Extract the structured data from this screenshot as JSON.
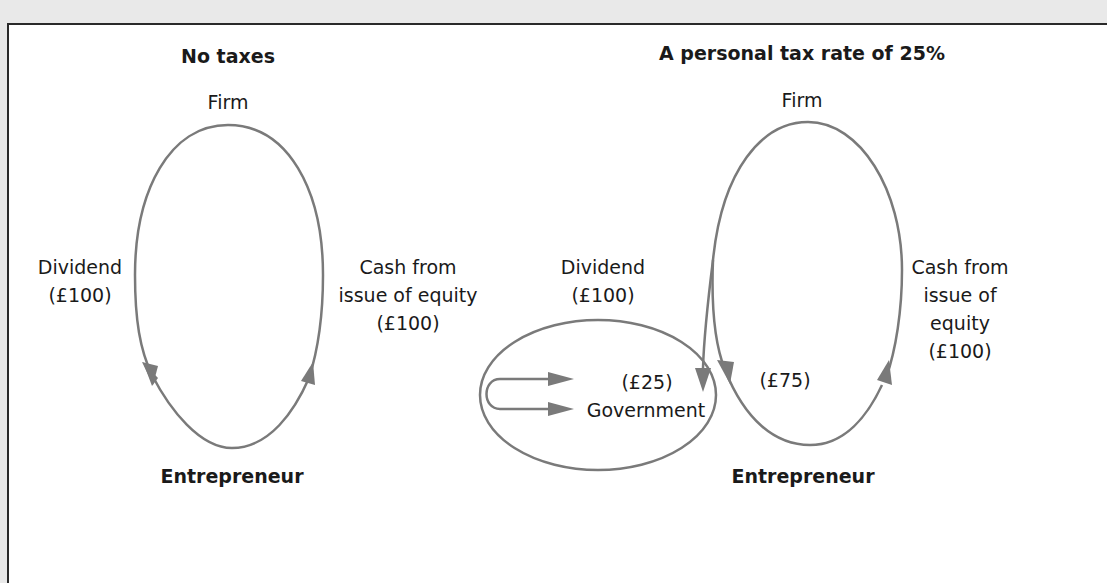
{
  "panels": {
    "left": {
      "title": "No taxes",
      "top_node": "Firm",
      "bottom_node": "Entrepreneur",
      "left_flow": {
        "line1": "Dividend",
        "line2": "(£100)"
      },
      "right_flow": {
        "line1": "Cash from",
        "line2": "issue of equity",
        "line3": "(£100)"
      }
    },
    "right": {
      "title": "A personal tax rate of 25%",
      "top_node": "Firm",
      "bottom_node": "Entrepreneur",
      "dividend_flow": {
        "line1": "Dividend",
        "line2": "(£100)"
      },
      "government": {
        "amount": "(£25)",
        "label": "Government"
      },
      "net_to_entrepreneur": "(£75)",
      "right_flow": {
        "line1": "Cash from",
        "line2": "issue of",
        "line3": "equity",
        "line4": "(£100)"
      }
    }
  },
  "colors": {
    "line": "#7a7a7a",
    "arrow": "#7a7a7a",
    "text": "#1a1a1a",
    "border": "#2a2a2a",
    "background": "#e9e9e9"
  }
}
